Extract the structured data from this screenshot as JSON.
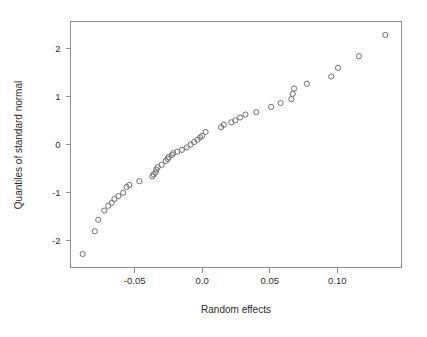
{
  "chart_data": {
    "type": "scatter",
    "title": "",
    "subtitle": "",
    "xlabel": "Random effects",
    "ylabel": "Quantiles of standard normal",
    "xlim": [
      -0.0975,
      0.1475
    ],
    "ylim": [
      -2.55,
      2.55
    ],
    "grid": false,
    "legend": null,
    "annotations": [],
    "xticks": [
      -0.05,
      0.0,
      0.05,
      0.1
    ],
    "xticklabels": [
      "-0.05",
      "0.0",
      "0.05",
      "0.10"
    ],
    "yticks": [
      2,
      1,
      0,
      -1,
      -2
    ],
    "yticklabels": [
      "2",
      "1",
      "0",
      "-1",
      "-2"
    ],
    "marker": "open-circle",
    "marker_color": "#6e6e6e",
    "marker_radius_px": 2.6,
    "frame_color": "#8c8c8c",
    "background": "#ffffff",
    "n_points": 46,
    "x": [
      -0.0885,
      -0.0795,
      -0.077,
      -0.0725,
      -0.0695,
      -0.067,
      -0.065,
      -0.062,
      -0.0585,
      -0.056,
      -0.054,
      -0.0465,
      -0.037,
      -0.036,
      -0.0345,
      -0.034,
      -0.033,
      -0.03,
      -0.027,
      -0.0255,
      -0.025,
      -0.0225,
      -0.0215,
      -0.0185,
      -0.015,
      -0.0115,
      -0.0085,
      -0.006,
      -0.0035,
      -0.0015,
      0.0,
      0.0025,
      0.014,
      0.016,
      0.0215,
      0.0245,
      0.028,
      0.032,
      0.04,
      0.051,
      0.058,
      0.066,
      0.067,
      0.0775,
      0.0955,
      0.1005,
      0.116,
      0.1355
    ],
    "y": [
      -2.27,
      -1.8,
      -1.56,
      -1.37,
      -1.27,
      -1.21,
      -1.13,
      -1.07,
      -1.0,
      -0.88,
      -0.84,
      -0.76,
      -0.66,
      -0.62,
      -0.58,
      -0.52,
      -0.47,
      -0.42,
      -0.34,
      -0.3,
      -0.26,
      -0.22,
      -0.18,
      -0.15,
      -0.11,
      -0.06,
      0.0,
      0.05,
      0.1,
      0.15,
      0.18,
      0.26,
      0.36,
      0.41,
      0.46,
      0.5,
      0.56,
      0.62,
      0.67,
      0.78,
      0.86,
      0.94,
      1.05,
      1.16,
      1.26,
      1.41,
      1.59,
      1.83,
      2.27
    ],
    "points": [
      {
        "x": -0.0885,
        "y": -2.27
      },
      {
        "x": -0.0795,
        "y": -1.8
      },
      {
        "x": -0.077,
        "y": -1.56
      },
      {
        "x": -0.0725,
        "y": -1.37
      },
      {
        "x": -0.0695,
        "y": -1.27
      },
      {
        "x": -0.067,
        "y": -1.21
      },
      {
        "x": -0.065,
        "y": -1.13
      },
      {
        "x": -0.062,
        "y": -1.07
      },
      {
        "x": -0.0585,
        "y": -1.0
      },
      {
        "x": -0.056,
        "y": -0.88
      },
      {
        "x": -0.054,
        "y": -0.84
      },
      {
        "x": -0.0465,
        "y": -0.76
      },
      {
        "x": -0.037,
        "y": -0.66
      },
      {
        "x": -0.036,
        "y": -0.62
      },
      {
        "x": -0.0345,
        "y": -0.58
      },
      {
        "x": -0.034,
        "y": -0.52
      },
      {
        "x": -0.033,
        "y": -0.47
      },
      {
        "x": -0.03,
        "y": -0.42
      },
      {
        "x": -0.027,
        "y": -0.34
      },
      {
        "x": -0.0255,
        "y": -0.3
      },
      {
        "x": -0.025,
        "y": -0.26
      },
      {
        "x": -0.0225,
        "y": -0.22
      },
      {
        "x": -0.0215,
        "y": -0.18
      },
      {
        "x": -0.0185,
        "y": -0.15
      },
      {
        "x": -0.015,
        "y": -0.11
      },
      {
        "x": -0.0115,
        "y": -0.06
      },
      {
        "x": -0.0085,
        "y": 0.0
      },
      {
        "x": -0.006,
        "y": 0.05
      },
      {
        "x": -0.0035,
        "y": 0.1
      },
      {
        "x": -0.0015,
        "y": 0.15
      },
      {
        "x": 0.0,
        "y": 0.18
      },
      {
        "x": 0.0025,
        "y": 0.26
      },
      {
        "x": 0.014,
        "y": 0.36
      },
      {
        "x": 0.016,
        "y": 0.41
      },
      {
        "x": 0.0215,
        "y": 0.46
      },
      {
        "x": 0.0245,
        "y": 0.5
      },
      {
        "x": 0.028,
        "y": 0.56
      },
      {
        "x": 0.032,
        "y": 0.62
      },
      {
        "x": 0.04,
        "y": 0.67
      },
      {
        "x": 0.051,
        "y": 0.78
      },
      {
        "x": 0.058,
        "y": 0.86
      },
      {
        "x": 0.066,
        "y": 0.94
      },
      {
        "x": 0.067,
        "y": 1.05
      },
      {
        "x": 0.068,
        "y": 1.16
      },
      {
        "x": 0.0775,
        "y": 1.26
      },
      {
        "x": 0.0955,
        "y": 1.41
      },
      {
        "x": 0.1005,
        "y": 1.59
      },
      {
        "x": 0.116,
        "y": 1.83
      },
      {
        "x": 0.1355,
        "y": 2.27
      }
    ]
  }
}
